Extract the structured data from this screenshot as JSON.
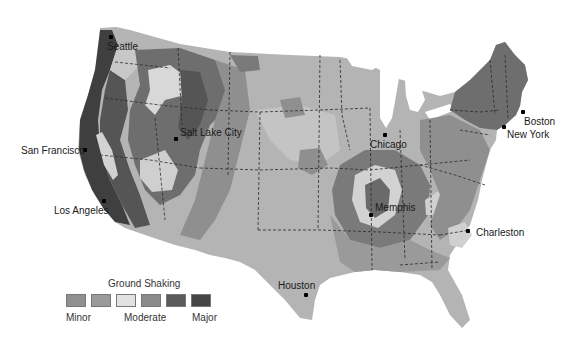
{
  "map": {
    "subject": "United States seismic hazard (ground shaking)",
    "colors": {
      "land_base": "#b4b4b4",
      "lighter": "#d2d2d2",
      "medium": "#8f8f8f",
      "dark": "#6e6e6e",
      "darker": "#555555",
      "darkest": "#3f3f3f",
      "border": "#2a2a2a"
    },
    "cities": [
      {
        "name": "Seattle",
        "x": 107,
        "y": 42,
        "dot_x": 111,
        "dot_y": 37
      },
      {
        "name": "San Francisco",
        "x": 21,
        "y": 148,
        "dot_x": 84,
        "dot_y": 150
      },
      {
        "name": "Los Angeles",
        "x": 54,
        "y": 207,
        "dot_x": 103,
        "dot_y": 200
      },
      {
        "name": "Salt Lake City",
        "x": 180,
        "y": 127,
        "dot_x": 175,
        "dot_y": 138
      },
      {
        "name": "Chicago",
        "x": 370,
        "y": 141,
        "dot_x": 384,
        "dot_y": 134
      },
      {
        "name": "Boston",
        "x": 524,
        "y": 117,
        "dot_x": 522,
        "dot_y": 111
      },
      {
        "name": "New York",
        "x": 507,
        "y": 130,
        "dot_x": 503,
        "dot_y": 126
      },
      {
        "name": "Memphis",
        "x": 375,
        "y": 204,
        "dot_x": 370,
        "dot_y": 214
      },
      {
        "name": "Charleston",
        "x": 476,
        "y": 229,
        "dot_x": 467,
        "dot_y": 230
      },
      {
        "name": "Houston",
        "x": 278,
        "y": 282,
        "dot_x": 305,
        "dot_y": 294
      }
    ]
  },
  "legend": {
    "title": "Ground Shaking",
    "swatches": [
      {
        "level": 1,
        "color": "#909090"
      },
      {
        "level": 2,
        "color": "#9a9a9a"
      },
      {
        "level": 3,
        "color": "#e2e2e2"
      },
      {
        "level": 4,
        "color": "#8a8a8a"
      },
      {
        "level": 5,
        "color": "#5a5a5a"
      },
      {
        "level": 6,
        "color": "#464646"
      }
    ],
    "labels": {
      "minor": "Minor",
      "moderate": "Moderate",
      "major": "Major"
    }
  }
}
